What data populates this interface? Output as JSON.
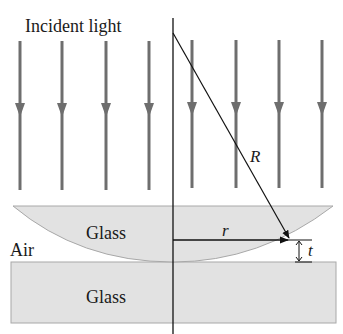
{
  "labels": {
    "incident": "Incident light",
    "R": "R",
    "r": "r",
    "t": "t",
    "air": "Air",
    "glass_lens": "Glass",
    "glass_plate": "Glass"
  },
  "colors": {
    "arrow": "#6e6e6e",
    "glass_fill": "#e2e2e2",
    "glass_stroke": "#a8a8a8",
    "line": "#111111"
  }
}
